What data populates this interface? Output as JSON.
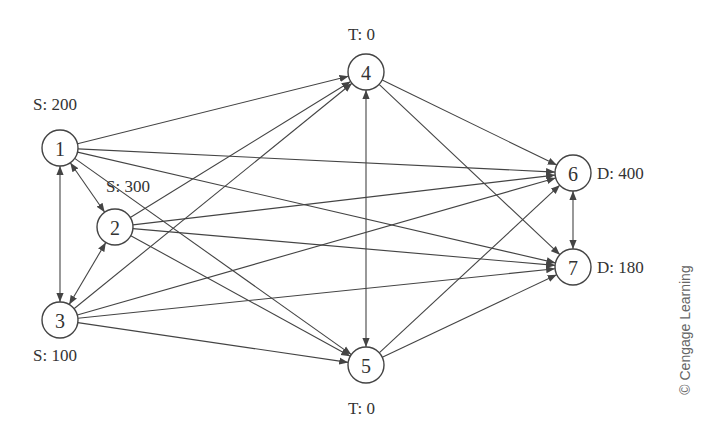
{
  "diagram": {
    "type": "network-flow",
    "node_radius": 18,
    "colors": {
      "line": "#444444",
      "text": "#333333",
      "credit": "#666666",
      "background": "#ffffff"
    },
    "nodes": [
      {
        "id": "1",
        "label": "1",
        "x": 60,
        "y": 148,
        "annotation": "S: 200",
        "ann_x": 33,
        "ann_y": 110,
        "role": "supply"
      },
      {
        "id": "2",
        "label": "2",
        "x": 115,
        "y": 227,
        "annotation": "S: 300",
        "ann_x": 106,
        "ann_y": 192,
        "role": "supply"
      },
      {
        "id": "3",
        "label": "3",
        "x": 60,
        "y": 320,
        "annotation": "S: 100",
        "ann_x": 33,
        "ann_y": 361,
        "role": "supply"
      },
      {
        "id": "4",
        "label": "4",
        "x": 366,
        "y": 72,
        "annotation": "T: 0",
        "ann_x": 348,
        "ann_y": 40,
        "role": "transshipment"
      },
      {
        "id": "5",
        "label": "5",
        "x": 366,
        "y": 365,
        "annotation": "T: 0",
        "ann_x": 348,
        "ann_y": 414,
        "role": "transshipment"
      },
      {
        "id": "6",
        "label": "6",
        "x": 573,
        "y": 173,
        "annotation": "D: 400",
        "ann_x": 597,
        "ann_y": 179,
        "role": "demand"
      },
      {
        "id": "7",
        "label": "7",
        "x": 573,
        "y": 267,
        "annotation": "D: 180",
        "ann_x": 597,
        "ann_y": 273,
        "role": "demand"
      }
    ],
    "edges": [
      {
        "from": "1",
        "to": "4",
        "bidirectional": false
      },
      {
        "from": "1",
        "to": "6",
        "bidirectional": false
      },
      {
        "from": "1",
        "to": "7",
        "bidirectional": false
      },
      {
        "from": "1",
        "to": "5",
        "bidirectional": false
      },
      {
        "from": "1",
        "to": "2",
        "bidirectional": true
      },
      {
        "from": "1",
        "to": "3",
        "bidirectional": true
      },
      {
        "from": "2",
        "to": "4",
        "bidirectional": false
      },
      {
        "from": "2",
        "to": "6",
        "bidirectional": false
      },
      {
        "from": "2",
        "to": "7",
        "bidirectional": false
      },
      {
        "from": "2",
        "to": "5",
        "bidirectional": false
      },
      {
        "from": "2",
        "to": "3",
        "bidirectional": true
      },
      {
        "from": "3",
        "to": "4",
        "bidirectional": false
      },
      {
        "from": "3",
        "to": "6",
        "bidirectional": false
      },
      {
        "from": "3",
        "to": "7",
        "bidirectional": false
      },
      {
        "from": "3",
        "to": "5",
        "bidirectional": false
      },
      {
        "from": "4",
        "to": "5",
        "bidirectional": true
      },
      {
        "from": "4",
        "to": "6",
        "bidirectional": false
      },
      {
        "from": "4",
        "to": "7",
        "bidirectional": false
      },
      {
        "from": "5",
        "to": "6",
        "bidirectional": false
      },
      {
        "from": "5",
        "to": "7",
        "bidirectional": false
      },
      {
        "from": "6",
        "to": "7",
        "bidirectional": true
      }
    ]
  },
  "credit": {
    "text": "© Cengage Learning",
    "x": 690,
    "y": 330
  }
}
